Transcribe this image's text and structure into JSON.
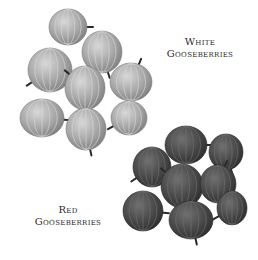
{
  "labels": {
    "white": {
      "line1": "White",
      "line2": "Gooseberries"
    },
    "red": {
      "line1": "Red",
      "line2": "Gooseberries"
    }
  },
  "clusters": {
    "white": {
      "fill": "#a8a8a8",
      "highlight": "#d6d6d6",
      "stroke": "#7a7a7a",
      "berries": [
        {
          "cx": 68,
          "cy": 27,
          "rx": 19,
          "ry": 18
        },
        {
          "cx": 102,
          "cy": 52,
          "rx": 20,
          "ry": 21
        },
        {
          "cx": 50,
          "cy": 70,
          "rx": 22,
          "ry": 22
        },
        {
          "cx": 85,
          "cy": 88,
          "rx": 20,
          "ry": 22
        },
        {
          "cx": 131,
          "cy": 82,
          "rx": 21,
          "ry": 19
        },
        {
          "cx": 42,
          "cy": 118,
          "rx": 22,
          "ry": 19
        },
        {
          "cx": 86,
          "cy": 129,
          "rx": 20,
          "ry": 21
        },
        {
          "cx": 129,
          "cy": 118,
          "rx": 18,
          "ry": 17
        }
      ]
    },
    "red": {
      "fill": "#4a4a4a",
      "highlight": "#6e6e6e",
      "stroke": "#2a2a2a",
      "berries": [
        {
          "cx": 186,
          "cy": 145,
          "rx": 21,
          "ry": 19
        },
        {
          "cx": 226,
          "cy": 152,
          "rx": 17,
          "ry": 18
        },
        {
          "cx": 152,
          "cy": 167,
          "rx": 19,
          "ry": 20
        },
        {
          "cx": 182,
          "cy": 186,
          "rx": 21,
          "ry": 22
        },
        {
          "cx": 218,
          "cy": 184,
          "rx": 18,
          "ry": 19
        },
        {
          "cx": 143,
          "cy": 211,
          "rx": 20,
          "ry": 20
        },
        {
          "cx": 191,
          "cy": 220,
          "rx": 22,
          "ry": 19
        },
        {
          "cx": 232,
          "cy": 208,
          "rx": 15,
          "ry": 17
        }
      ]
    }
  }
}
